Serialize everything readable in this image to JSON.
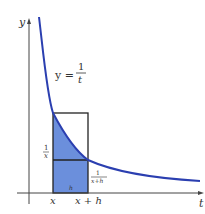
{
  "diagram": {
    "axes": {
      "x_label": "t",
      "y_label": "y"
    },
    "curve": {
      "equation_lhs": "y =",
      "equation_num": "1",
      "equation_den": "t",
      "color": "#2b3fb0"
    },
    "region": {
      "fill_color": "#6b8fdc",
      "width_label": "h"
    },
    "ticks": {
      "left": "x",
      "right": "x + h"
    },
    "heights": {
      "left_num": "1",
      "left_den": "x",
      "right_num": "1",
      "right_den": "x+h"
    }
  }
}
